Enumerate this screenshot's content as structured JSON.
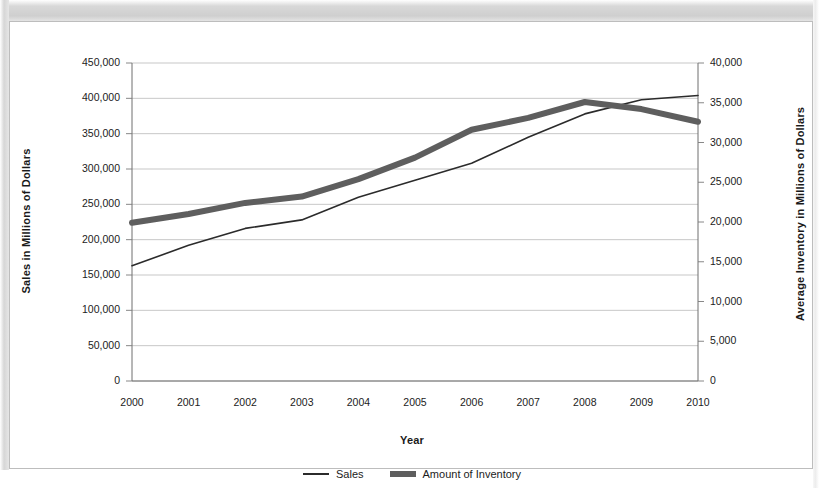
{
  "chart_data": {
    "type": "line",
    "title": "",
    "xlabel": "Year",
    "ylabel": "Sales in Millions of Dollars",
    "y2label": "Average Inventory in Millions of Dollars",
    "categories": [
      "2000",
      "2001",
      "2002",
      "2003",
      "2004",
      "2005",
      "2006",
      "2007",
      "2008",
      "2009",
      "2010"
    ],
    "ylim": [
      0,
      450000
    ],
    "y2lim": [
      0,
      40000
    ],
    "yticks": [
      "0",
      "50,000",
      "100,000",
      "150,000",
      "200,000",
      "250,000",
      "300,000",
      "350,000",
      "400,000",
      "450,000"
    ],
    "y2ticks": [
      "0",
      "5,000",
      "10,000",
      "15,000",
      "20,000",
      "25,000",
      "30,000",
      "35,000",
      "40,000"
    ],
    "grid": true,
    "legend_position": "bottom",
    "series": [
      {
        "name": "Sales",
        "axis": "left",
        "color": "#2b2b2b",
        "line_width": 1.6,
        "values": [
          163000,
          192000,
          216000,
          228000,
          260000,
          284000,
          308000,
          345000,
          378000,
          398000,
          404000
        ]
      },
      {
        "name": "Amount of Inventory",
        "axis": "right",
        "color": "#5e5e5e",
        "line_width": 6,
        "values": [
          19900,
          21000,
          22400,
          23200,
          25400,
          28100,
          31600,
          33100,
          35100,
          34200,
          32600
        ]
      }
    ]
  },
  "legend": {
    "sales_label": "Sales",
    "inventory_label": "Amount of Inventory"
  }
}
